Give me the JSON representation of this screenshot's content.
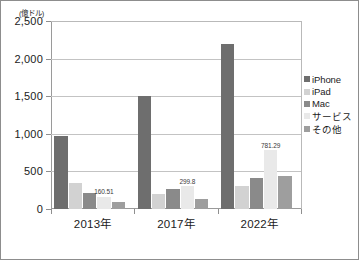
{
  "chart_data": {
    "type": "bar",
    "title": "",
    "subtitle": "",
    "xlabel": "",
    "ylabel": "(億ドル)",
    "unit_label": "(億ドル)",
    "categories": [
      "2013年",
      "2017年",
      "2022年"
    ],
    "ylim": [
      0,
      2500
    ],
    "yticks": [
      0,
      500,
      1000,
      1500,
      2000,
      2500
    ],
    "ytick_labels": [
      "0",
      "500",
      "1,000",
      "1,500",
      "2,000",
      "2,500"
    ],
    "grid": true,
    "legend_position": "right",
    "series": [
      {
        "name": "iPhone",
        "color": "#6e6e6e",
        "values": [
          970,
          1500,
          2200
        ]
      },
      {
        "name": "iPad",
        "color": "#d2d2d2",
        "values": [
          340,
          198,
          300
        ]
      },
      {
        "name": "Mac",
        "color": "#8a8a8a",
        "values": [
          215,
          272,
          415
        ]
      },
      {
        "name": "サービス",
        "color": "#e9e9e9",
        "values": [
          160.51,
          299.8,
          781.29
        ]
      },
      {
        "name": "その他",
        "color": "#9e9e9e",
        "values": [
          98,
          130,
          435
        ]
      }
    ],
    "data_labels": [
      {
        "series": "サービス",
        "category": "2013年",
        "text": "160.51"
      },
      {
        "series": "サービス",
        "category": "2017年",
        "text": "299.8"
      },
      {
        "series": "サービス",
        "category": "2022年",
        "text": "781.29"
      }
    ]
  },
  "legend": {
    "items": [
      {
        "label": "iPhone",
        "color": "#6e6e6e"
      },
      {
        "label": "iPad",
        "color": "#d2d2d2"
      },
      {
        "label": "Mac",
        "color": "#8a8a8a"
      },
      {
        "label": "サービス",
        "color": "#e9e9e9"
      },
      {
        "label": "その他",
        "color": "#9e9e9e"
      }
    ]
  }
}
